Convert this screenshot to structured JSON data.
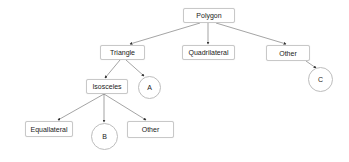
{
  "diagram": {
    "type": "tree",
    "nodes": [
      {
        "id": "polygon",
        "label": "Polygon",
        "shape": "box"
      },
      {
        "id": "triangle",
        "label": "Triangle",
        "shape": "box"
      },
      {
        "id": "quadrilateral",
        "label": "Quadrilateral",
        "shape": "box"
      },
      {
        "id": "other_top",
        "label": "Other",
        "shape": "box"
      },
      {
        "id": "isosceles",
        "label": "Isosceles",
        "shape": "box"
      },
      {
        "id": "a",
        "label": "A",
        "shape": "circle"
      },
      {
        "id": "c",
        "label": "C",
        "shape": "circle"
      },
      {
        "id": "equallateral",
        "label": "Equallateral",
        "shape": "box"
      },
      {
        "id": "b",
        "label": "B",
        "shape": "circle"
      },
      {
        "id": "other_bottom",
        "label": "Other",
        "shape": "box"
      }
    ],
    "edges": [
      {
        "from": "polygon",
        "to": "triangle"
      },
      {
        "from": "polygon",
        "to": "quadrilateral"
      },
      {
        "from": "polygon",
        "to": "other_top"
      },
      {
        "from": "triangle",
        "to": "isosceles"
      },
      {
        "from": "triangle",
        "to": "a"
      },
      {
        "from": "other_top",
        "to": "c"
      },
      {
        "from": "isosceles",
        "to": "equallateral"
      },
      {
        "from": "isosceles",
        "to": "b"
      },
      {
        "from": "isosceles",
        "to": "other_bottom"
      }
    ],
    "colors": {
      "edge": "#555555",
      "node_border": "#c8c8c8",
      "text": "#222222"
    }
  }
}
